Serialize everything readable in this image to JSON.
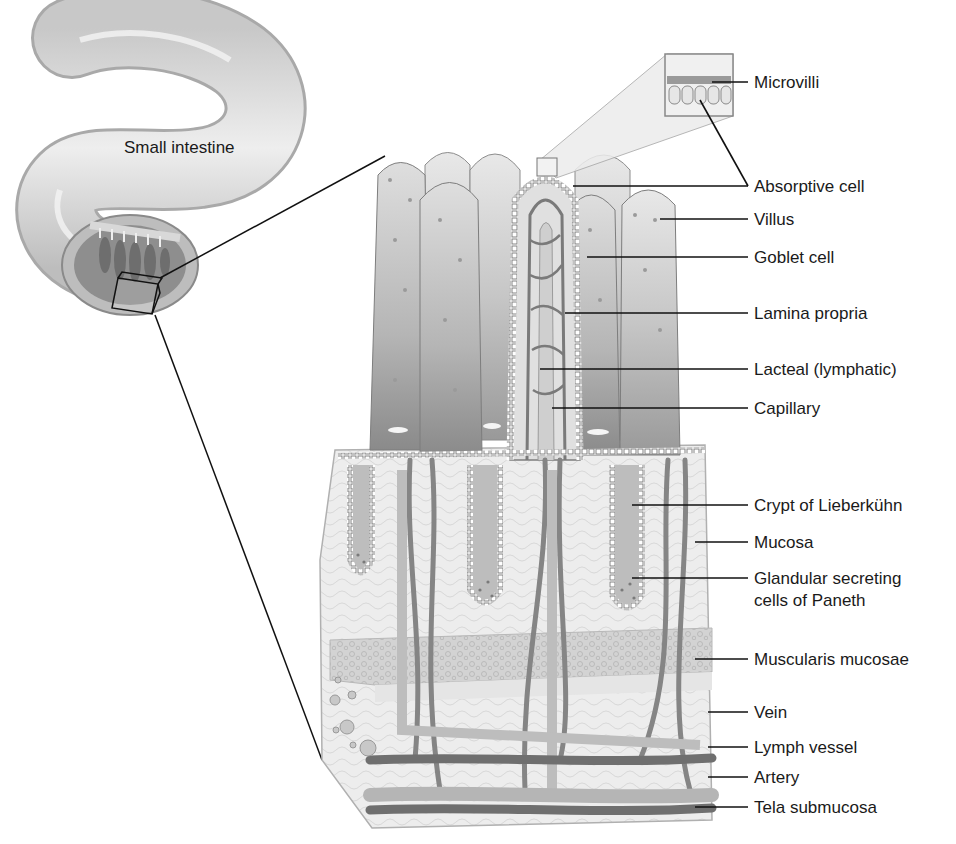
{
  "diagram": {
    "organ_label": "Small intestine",
    "colors": {
      "background": "#ffffff",
      "villus_light": "#d9d9d9",
      "villus_dark": "#8f8f8f",
      "tissue": "#ececec",
      "vessel": "#7a7a7a",
      "line": "#111111"
    },
    "labels": [
      {
        "id": "microvilli",
        "text": "Microvilli"
      },
      {
        "id": "absorptive-cell",
        "text": "Absorptive cell"
      },
      {
        "id": "villus",
        "text": "Villus"
      },
      {
        "id": "goblet-cell",
        "text": "Goblet cell"
      },
      {
        "id": "lamina-propria",
        "text": "Lamina propria"
      },
      {
        "id": "lacteal",
        "text": "Lacteal (lymphatic)"
      },
      {
        "id": "capillary",
        "text": "Capillary"
      },
      {
        "id": "crypt",
        "text": "Crypt of Lieberkühn"
      },
      {
        "id": "mucosa",
        "text": "Mucosa"
      },
      {
        "id": "paneth-line1",
        "text": "Glandular secreting"
      },
      {
        "id": "paneth-line2",
        "text": "cells of Paneth"
      },
      {
        "id": "muscularis-mucosae",
        "text": "Muscularis mucosae"
      },
      {
        "id": "vein",
        "text": "Vein"
      },
      {
        "id": "lymph-vessel",
        "text": "Lymph vessel"
      },
      {
        "id": "artery",
        "text": "Artery"
      },
      {
        "id": "tela-submucosa",
        "text": "Tela submucosa"
      }
    ]
  }
}
